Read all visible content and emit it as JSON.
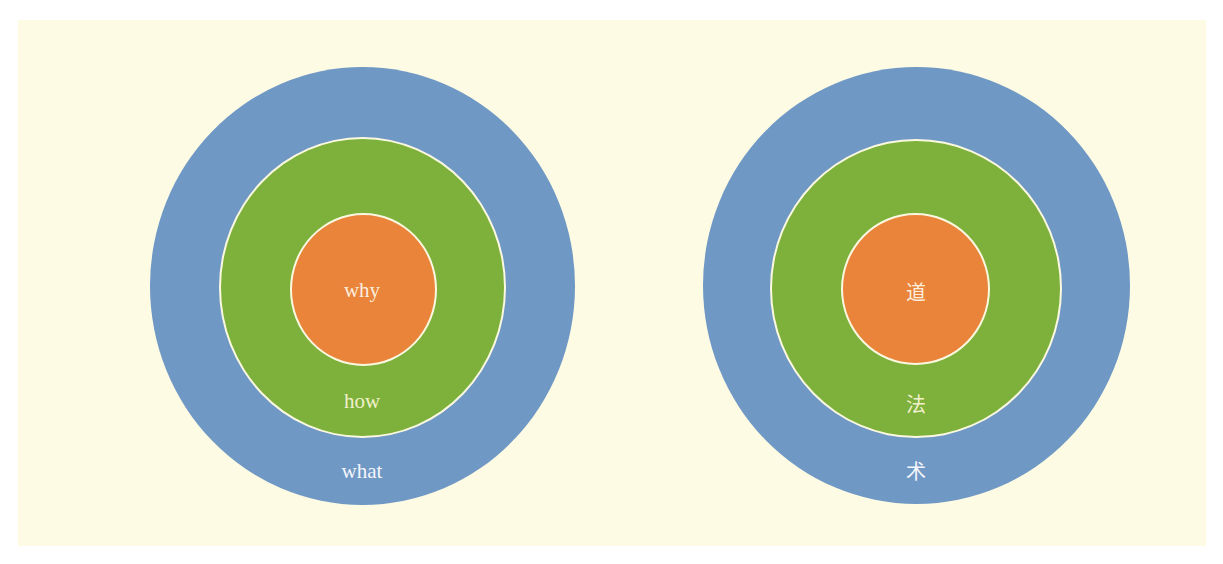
{
  "colors": {
    "background": "#fdfbe4",
    "outer_ring": "#6f98c5",
    "middle_ring": "#7db13b",
    "inner_circle": "#e9843a",
    "ring_border": "#fbf8e0"
  },
  "diagrams": [
    {
      "name": "golden-circle-english",
      "labels": {
        "inner": "why",
        "middle": "how",
        "outer": "what"
      }
    },
    {
      "name": "golden-circle-chinese",
      "labels": {
        "inner": "道",
        "middle": "法",
        "outer": "术"
      }
    }
  ]
}
